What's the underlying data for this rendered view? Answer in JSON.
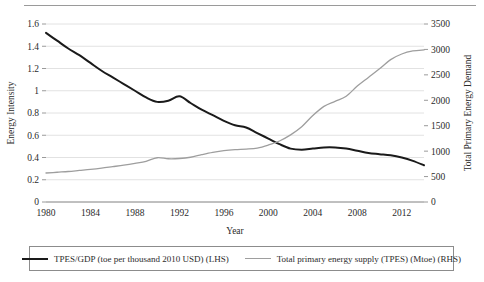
{
  "chart_data": {
    "type": "line",
    "title": "",
    "xlabel": "Year",
    "ylabel": "Energy Intensity",
    "y2label": "Total Primary Energy Demand",
    "xlim": [
      1980,
      2014
    ],
    "ylim": [
      0,
      1.6
    ],
    "y2lim": [
      0,
      3500
    ],
    "grid": true,
    "legend_position": "bottom",
    "xticks": [
      1980,
      1984,
      1988,
      1992,
      1996,
      2000,
      2004,
      2008,
      2012
    ],
    "yticks": [
      0,
      0.2,
      0.4,
      0.6,
      0.8,
      1,
      1.2,
      1.4,
      1.6
    ],
    "y2ticks": [
      0,
      500,
      1000,
      1500,
      2000,
      2500,
      3000,
      3500
    ],
    "x": [
      1980,
      1981,
      1982,
      1983,
      1984,
      1985,
      1986,
      1987,
      1988,
      1989,
      1990,
      1991,
      1992,
      1993,
      1994,
      1995,
      1996,
      1997,
      1998,
      1999,
      2000,
      2001,
      2002,
      2003,
      2004,
      2005,
      2006,
      2007,
      2008,
      2009,
      2010,
      2011,
      2012,
      2013,
      2014
    ],
    "series": [
      {
        "name": "TPES/GDP (toe per thousand 2010 USD) (LHS)",
        "axis": "left",
        "color": "#1a1a1a",
        "values": [
          1.52,
          1.45,
          1.38,
          1.32,
          1.25,
          1.18,
          1.12,
          1.06,
          1.0,
          0.94,
          0.9,
          0.91,
          0.95,
          0.89,
          0.83,
          0.78,
          0.73,
          0.69,
          0.67,
          0.62,
          0.57,
          0.52,
          0.48,
          0.47,
          0.48,
          0.49,
          0.49,
          0.48,
          0.46,
          0.44,
          0.43,
          0.42,
          0.4,
          0.37,
          0.33
        ]
      },
      {
        "name": "Total primary energy supply (TPES) (Mtoe) (RHS)",
        "axis": "right",
        "color": "#9e9e9e",
        "values": [
          570,
          585,
          600,
          620,
          640,
          665,
          695,
          725,
          760,
          800,
          870,
          850,
          855,
          880,
          930,
          975,
          1010,
          1030,
          1040,
          1060,
          1120,
          1200,
          1320,
          1480,
          1700,
          1880,
          1980,
          2080,
          2280,
          2450,
          2620,
          2800,
          2910,
          2970,
          2990
        ]
      }
    ]
  },
  "legend": {
    "entries": [
      {
        "label": "TPES/GDP (toe per thousand 2010 USD) (LHS)",
        "style": "dark"
      },
      {
        "label": "Total primary energy supply (TPES) (Mtoe) (RHS)",
        "style": "gray"
      }
    ]
  }
}
